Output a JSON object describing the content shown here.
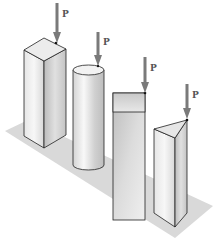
{
  "figure": {
    "colors": {
      "background": "#ffffff",
      "ground": "#d9d9d9",
      "outline": "#222222",
      "arrow": "#7a7a7a",
      "label": "#555555"
    },
    "columns": [
      {
        "shape": "square-prism",
        "load_label": "P"
      },
      {
        "shape": "cylinder",
        "load_label": "P"
      },
      {
        "shape": "rectangular-prism",
        "load_label": "P"
      },
      {
        "shape": "triangular-prism",
        "load_label": "P"
      }
    ]
  }
}
